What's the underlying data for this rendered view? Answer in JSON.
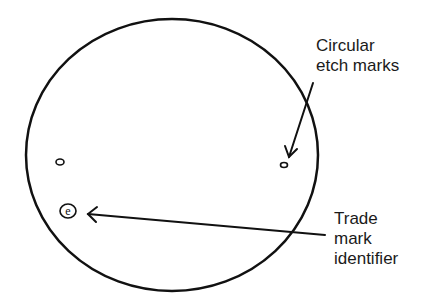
{
  "diagram": {
    "colors": {
      "stroke": "#111111",
      "text": "#1a1a1a",
      "background": "#ffffff"
    },
    "lens_outline": {
      "cx": 172,
      "cy": 155,
      "rx": 146,
      "ry": 136
    },
    "marks": [
      {
        "name": "etch-mark-left",
        "cx": 60,
        "cy": 162,
        "rx": 4,
        "ry": 3
      },
      {
        "name": "etch-mark-right",
        "cx": 284,
        "cy": 165,
        "rx": 3.5,
        "ry": 2.5
      }
    ],
    "trademark": {
      "cx": 68,
      "cy": 211,
      "r": 8,
      "glyph": "e"
    },
    "labels": {
      "etch": {
        "line1": "Circular",
        "line2": "etch marks"
      },
      "trademark": {
        "line1": "Trade",
        "line2": "mark",
        "line3": "identifier"
      }
    },
    "arrows": [
      {
        "name": "etch-arrow",
        "x1": 313,
        "y1": 83,
        "x2": 289,
        "y2": 157
      },
      {
        "name": "trademark-arrow",
        "x1": 325,
        "y1": 235,
        "x2": 88,
        "y2": 214
      }
    ]
  }
}
